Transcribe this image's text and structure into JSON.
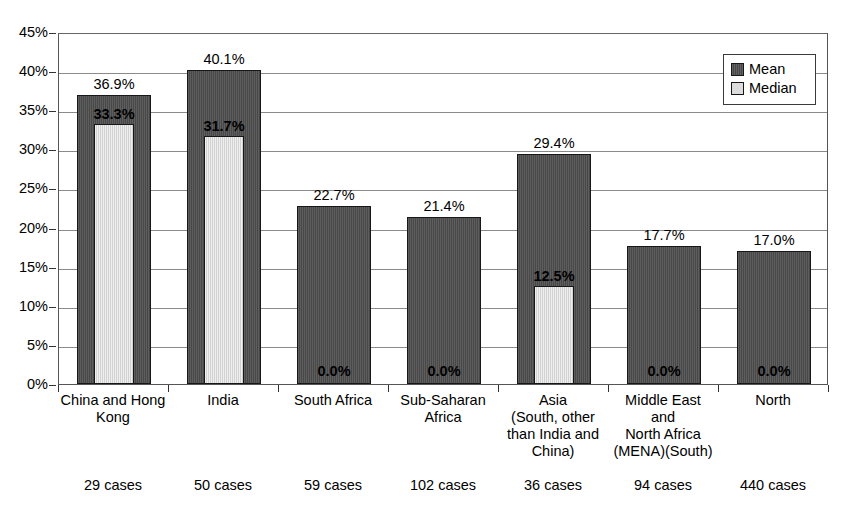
{
  "chart_data": {
    "type": "bar",
    "title": "",
    "xlabel": "",
    "ylabel": "",
    "ylim": [
      0,
      45
    ],
    "ytick_labels": [
      "0%",
      "5%",
      "10%",
      "15%",
      "20%",
      "25%",
      "30%",
      "35%",
      "40%",
      "45%"
    ],
    "ytick_values": [
      0,
      5,
      10,
      15,
      20,
      25,
      30,
      35,
      40,
      45
    ],
    "grid": true,
    "legend_position": "top-right",
    "categories": [
      "China and Hong Kong",
      "India",
      "South Africa",
      "Sub-Saharan Africa",
      "Asia (South, other than India and China)",
      "Middle East and North Africa (MENA)(South)",
      "North"
    ],
    "category_label_lines": [
      [
        "China and Hong",
        "Kong"
      ],
      [
        "India"
      ],
      [
        "South Africa"
      ],
      [
        "Sub-Saharan",
        "Africa"
      ],
      [
        "Asia",
        "(South, other",
        "than India and",
        "China)"
      ],
      [
        "Middle East",
        "and",
        "North Africa",
        "(MENA)(South)"
      ],
      [
        "North"
      ]
    ],
    "cases": [
      "29 cases",
      "50 cases",
      "59 cases",
      "102 cases",
      "36 cases",
      "94 cases",
      "440 cases"
    ],
    "series": [
      {
        "name": "Mean",
        "color": "#4c4c4c",
        "values": [
          36.9,
          40.1,
          22.7,
          21.4,
          29.4,
          17.7,
          17.0
        ],
        "labels": [
          "36.9%",
          "40.1%",
          "22.7%",
          "21.4%",
          "29.4%",
          "17.7%",
          "17.0%"
        ]
      },
      {
        "name": "Median",
        "color": "#dcdcdc",
        "values": [
          33.3,
          31.7,
          0.0,
          0.0,
          12.5,
          0.0,
          0.0
        ],
        "labels": [
          "33.3%",
          "31.7%",
          "0.0%",
          "0.0%",
          "12.5%",
          "0.0%",
          "0.0%"
        ]
      }
    ]
  },
  "legend": {
    "entries": [
      {
        "label": "Mean",
        "swatch": "mean-swatch"
      },
      {
        "label": "Median",
        "swatch": "median-swatch"
      }
    ]
  }
}
